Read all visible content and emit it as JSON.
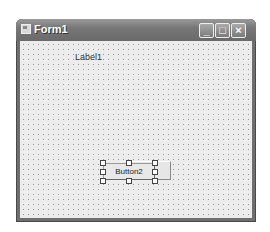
{
  "window": {
    "title": "Form1",
    "buttons": {
      "minimize": "_",
      "maximize": "□",
      "close": "×"
    }
  },
  "form": {
    "label1": "Label1",
    "button2": "Button2",
    "button_behind": ""
  },
  "colors": {
    "titlebar": "#777777",
    "client": "#ececec",
    "grid_dot": "#9a9a9a"
  }
}
